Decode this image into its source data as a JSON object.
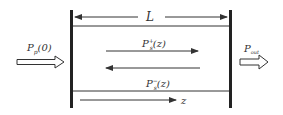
{
  "diagram": {
    "length_label": "L",
    "input_label": "P",
    "input_sub": "p",
    "input_arg": "(0)",
    "output_label": "P",
    "output_sub": "out",
    "forward_label": "P",
    "forward_sup": "+",
    "forward_sub": "s",
    "forward_arg": "(z)",
    "backward_label": "P",
    "backward_sup": "−",
    "backward_sub": "s",
    "backward_arg": "(z)",
    "axis_label": "z"
  },
  "colors": {
    "line": "#222222",
    "text": "#333333"
  }
}
